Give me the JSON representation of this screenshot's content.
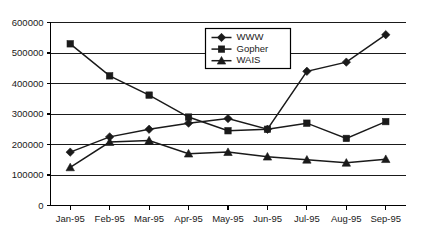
{
  "chart_data": {
    "type": "line",
    "title": "",
    "xlabel": "",
    "ylabel": "",
    "categories": [
      "Jan-95",
      "Feb-95",
      "Mar-95",
      "Apr-95",
      "May-95",
      "Jun-95",
      "Jul-95",
      "Aug-95",
      "Sep-95"
    ],
    "ylim": [
      0,
      600000
    ],
    "ytick_values": [
      0,
      100000,
      200000,
      300000,
      400000,
      500000,
      600000
    ],
    "ytick_labels": [
      "0",
      "100000",
      "200000",
      "300000",
      "400000",
      "500000",
      "600000"
    ],
    "grid": true,
    "legend_position": "top-center",
    "series": [
      {
        "name": "WWW",
        "marker": "diamond",
        "color": "#1a1a1a",
        "values": [
          175000,
          225000,
          250000,
          270000,
          285000,
          250000,
          440000,
          470000,
          560000
        ]
      },
      {
        "name": "Gopher",
        "marker": "square",
        "color": "#1a1a1a",
        "values": [
          530000,
          425000,
          362000,
          290000,
          245000,
          250000,
          270000,
          220000,
          275000
        ]
      },
      {
        "name": "WAIS",
        "marker": "triangle",
        "color": "#1a1a1a",
        "values": [
          125000,
          208000,
          213000,
          170000,
          175000,
          160000,
          150000,
          140000,
          152000
        ]
      }
    ]
  },
  "legend": {
    "entries": [
      "WWW",
      "Gopher",
      "WAIS"
    ]
  }
}
